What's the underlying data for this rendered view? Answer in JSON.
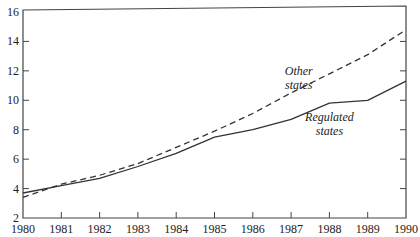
{
  "chart_data": {
    "type": "line",
    "title": "",
    "xlabel": "",
    "ylabel": "",
    "x": [
      1980,
      1981,
      1982,
      1983,
      1984,
      1985,
      1986,
      1987,
      1988,
      1989,
      1990
    ],
    "xlim": [
      1980,
      1990
    ],
    "ylim": [
      2,
      16
    ],
    "yticks": [
      2,
      4,
      6,
      8,
      10,
      12,
      14,
      16
    ],
    "xticks": [
      1980,
      1981,
      1982,
      1983,
      1984,
      1985,
      1986,
      1987,
      1988,
      1989,
      1990
    ],
    "grid": false,
    "legend": "inline annotations",
    "series": [
      {
        "name": "Other states",
        "style": "dashed",
        "values": [
          3.4,
          4.3,
          4.9,
          5.7,
          6.8,
          7.9,
          9.1,
          10.5,
          11.8,
          13.1,
          14.8
        ]
      },
      {
        "name": "Regulated states",
        "style": "solid",
        "values": [
          3.7,
          4.2,
          4.7,
          5.5,
          6.4,
          7.5,
          8.0,
          8.7,
          9.8,
          10.0,
          11.3
        ]
      }
    ],
    "annotations": [
      {
        "text": [
          "Other",
          "states"
        ],
        "x": 1987.2,
        "y": 11.7
      },
      {
        "text": [
          "Regulated",
          "states"
        ],
        "x": 1988.0,
        "y": 8.6
      }
    ]
  },
  "colors": {
    "line": "#333333",
    "axis": "#444444",
    "text": "#222222"
  }
}
